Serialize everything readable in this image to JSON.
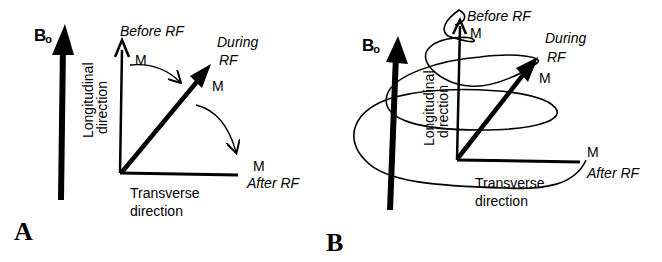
{
  "panels": [
    {
      "id": "A",
      "label": "A",
      "field_label": "B",
      "field_subscript": "o",
      "axis_vertical": [
        "Longitudinal",
        "direction"
      ],
      "axis_horizontal": [
        "Transverse",
        "direction"
      ],
      "states": {
        "before": {
          "vector": "M",
          "label": "Before RF"
        },
        "during": {
          "vector": "M",
          "label_line1": "During",
          "label_line2": "RF"
        },
        "after": {
          "vector": "M",
          "label": "After RF"
        }
      }
    },
    {
      "id": "B",
      "label": "B",
      "field_label": "B",
      "field_subscript": "o",
      "axis_vertical": [
        "Longitudinal",
        "direction"
      ],
      "axis_horizontal": [
        "Transverse",
        "direction"
      ],
      "states": {
        "before": {
          "vector": "M",
          "label": "Before RF"
        },
        "during": {
          "vector": "M",
          "label_line1": "During",
          "label_line2": "RF"
        },
        "after": {
          "vector": "M",
          "label": "After RF"
        }
      }
    }
  ]
}
